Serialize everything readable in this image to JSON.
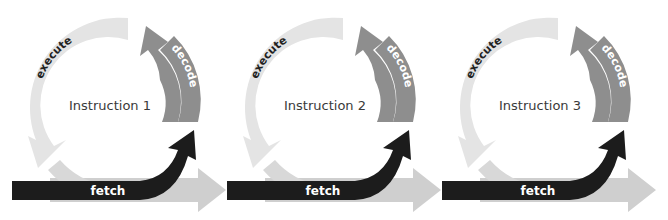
{
  "diagram": {
    "type": "instruction-pipeline-cycles",
    "colors": {
      "execute": "#e4e4e4",
      "decode": "#8e8e8e",
      "fetch": "#1c1c1c",
      "pipeline_arrow": "#cfcfcf",
      "text_dark": "#3a3a3a",
      "text_light": "#ffffff"
    },
    "panels": [
      {
        "title": "Instruction 1",
        "stages": {
          "execute": "execute",
          "decode": "decode",
          "fetch": "fetch"
        }
      },
      {
        "title": "Instruction 2",
        "stages": {
          "execute": "execute",
          "decode": "decode",
          "fetch": "fetch"
        }
      },
      {
        "title": "Instruction 3",
        "stages": {
          "execute": "execute",
          "decode": "decode",
          "fetch": "fetch"
        }
      }
    ]
  }
}
